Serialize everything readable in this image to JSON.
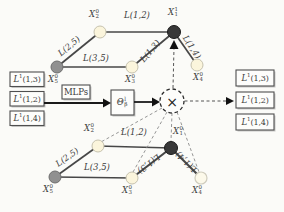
{
  "colors": {
    "node_dark": "#383838",
    "node_gray": "#909090",
    "node_light": "#fbf5dc",
    "edge": "#474747",
    "dashed": "#8a8a8a",
    "text": "#3c3c3c"
  },
  "graphs": {
    "top": {
      "nodes": [
        {
          "base": "X",
          "sub": "5",
          "sup": "0"
        },
        {
          "base": "X",
          "sub": "2",
          "sup": "0"
        },
        {
          "base": "X",
          "sub": "3",
          "sup": "0"
        },
        {
          "base": "X",
          "sub": "1",
          "sup": "1"
        },
        {
          "base": "X",
          "sub": "4",
          "sup": "0"
        }
      ],
      "edge_labels": [
        "L(1,2)",
        "L(2,5)",
        "L(3,5)",
        "L(1,3)",
        "L(1,4)"
      ]
    },
    "bottom": {
      "nodes": [
        {
          "base": "X",
          "sub": "5",
          "sup": "0"
        },
        {
          "base": "X",
          "sub": "2",
          "sup": "0"
        },
        {
          "base": "X",
          "sub": "3",
          "sup": "0"
        },
        {
          "base": "X",
          "sub": "1",
          "sup": "0"
        },
        {
          "base": "X",
          "sub": "4",
          "sup": "0"
        }
      ],
      "edge_labels": [
        "L(1,2)",
        "L(2,5)",
        "L(3,5)",
        "L(1,3)",
        "L(1,4)"
      ]
    }
  },
  "pipeline": {
    "left_boxes": [
      {
        "base": "L",
        "sup": "1",
        "args": "(1,3)"
      },
      {
        "base": "L",
        "sup": "1",
        "args": "(1,2)"
      },
      {
        "base": "L",
        "sup": "1",
        "args": "(1,4)"
      }
    ],
    "right_boxes": [
      {
        "base": "L",
        "sup": "1",
        "args": "(1,3)"
      },
      {
        "base": "L",
        "sup": "1",
        "args": "(1,2)"
      },
      {
        "base": "L",
        "sup": "1",
        "args": "(1,4)"
      }
    ],
    "mlps_label": "MLPs",
    "theta": {
      "base": "Θ",
      "sup": "l",
      "sub": "β"
    },
    "multiply_symbol": "×"
  }
}
